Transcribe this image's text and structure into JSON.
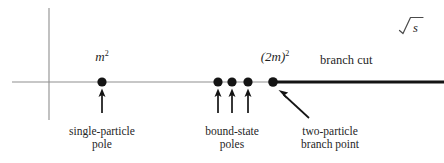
{
  "figure": {
    "name": "complex-s-plane-analytic-structure",
    "width": 444,
    "height": 163,
    "background": "#ffffff",
    "axis_color": "#8a8a8a",
    "ink_color": "#1a1a1a"
  },
  "axes": {
    "variable_label": "s",
    "variable_label_kind": "sqrt",
    "real_axis": {
      "y": 82,
      "x_start": 12,
      "x_end": 444
    },
    "imaginary_axis": {
      "x": 49,
      "y_start": 8,
      "y_end": 120
    }
  },
  "labels": {
    "single_pole": {
      "base": "m",
      "exponent": "2"
    },
    "threshold": {
      "base": "(2m)",
      "exponent": "2"
    },
    "branch_cut": "branch cut"
  },
  "captions": {
    "single_particle": {
      "line1": "single-particle",
      "line2": "pole"
    },
    "bound_state": {
      "line1": "bound-state",
      "line2": "poles"
    },
    "two_particle": {
      "line1": "two-particle",
      "line2": "branch point"
    }
  },
  "poles": [
    {
      "name": "single-particle-pole",
      "x": 102,
      "y": 82,
      "r": 4.6
    },
    {
      "name": "bound-state-pole-1",
      "x": 218,
      "y": 82,
      "r": 4.6
    },
    {
      "name": "bound-state-pole-2",
      "x": 232,
      "y": 82,
      "r": 4.6
    },
    {
      "name": "bound-state-pole-3",
      "x": 248,
      "y": 82,
      "r": 4.6
    },
    {
      "name": "two-particle-branch-point",
      "x": 273,
      "y": 82,
      "r": 4.6
    }
  ],
  "branch_cut": {
    "x_start": 273,
    "x_end": 444,
    "y": 82,
    "thickness": 3.2
  },
  "arrows": {
    "single_particle": {
      "x": 102,
      "y_tail": 113,
      "y_head": 90
    },
    "bound_state": [
      {
        "x": 218,
        "y_tail": 113,
        "y_head": 90
      },
      {
        "x": 232,
        "y_tail": 113,
        "y_head": 90
      },
      {
        "x": 248,
        "y_tail": 113,
        "y_head": 90
      }
    ],
    "two_particle": {
      "x_tail": 309,
      "y_tail": 118,
      "x_head": 279,
      "y_head": 90
    }
  }
}
